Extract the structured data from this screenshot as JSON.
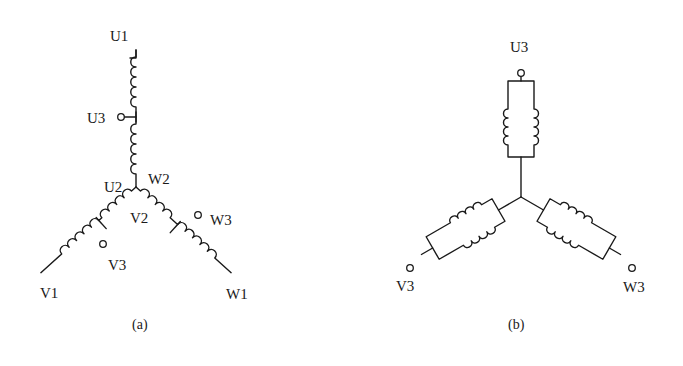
{
  "figure": {
    "type": "wye-connected winding schematic",
    "background_color": "#ffffff",
    "line_color": "#1a1a1a"
  },
  "diagram_a": {
    "caption": "(a)",
    "description": "Tapped star (Y) windings with intermediate taps",
    "labels": {
      "u1": "U1",
      "u3": "U3",
      "u2": "U2",
      "w2": "W2",
      "v2": "V2",
      "w3": "W3",
      "v3": "V3",
      "v1": "V1",
      "w1": "W1"
    }
  },
  "diagram_b": {
    "caption": "(b)",
    "description": "Star connection with parallel coil pairs per phase",
    "labels": {
      "u3": "U3",
      "v3": "V3",
      "w3": "W3"
    }
  }
}
